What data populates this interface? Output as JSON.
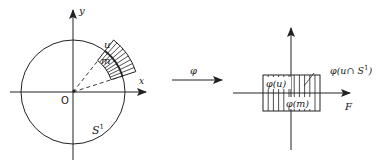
{
  "left_figure": {
    "axis_x_label": "x",
    "axis_y_label": "y",
    "origin_label": "O",
    "circle_label": "S",
    "circle_label_sup": "1",
    "neighborhood_outer_label": "u",
    "neighborhood_inner_label": "m"
  },
  "map": {
    "label": "φ"
  },
  "right_figure": {
    "axis_x_label": "F",
    "image_u_label": "φ(u)",
    "image_m_label": "φ(m)",
    "image_intersection_label": "φ(u∩ S",
    "image_intersection_sup": "1",
    "image_intersection_close": ")"
  },
  "colors": {
    "ink": "#222222",
    "background": "#ffffff"
  }
}
